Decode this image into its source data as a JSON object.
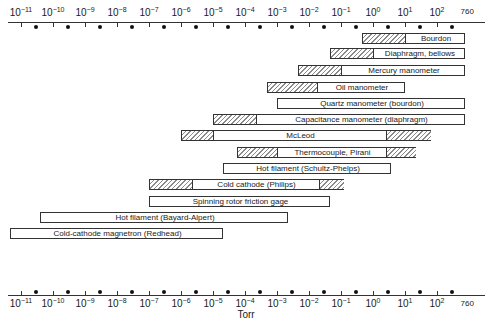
{
  "chart_data": {
    "type": "bar",
    "subtype": "floating-range-bar",
    "title": "",
    "xlabel": "Torr",
    "ylabel": "",
    "xscale": "log",
    "xlim_log10": [
      -11,
      2.88
    ],
    "x_ticks": [
      "10^-11",
      "10^-10",
      "10^-9",
      "10^-8",
      "10^-7",
      "10^-6",
      "10^-5",
      "10^-4",
      "10^-3",
      "10^-2",
      "10^-1",
      "10^0",
      "10^1",
      "10^2",
      "760"
    ],
    "grid": false,
    "legend": "none",
    "series": [
      {
        "name": "Bourdon",
        "range_log10": [
          -0.35,
          2.88
        ],
        "hatched": [
          [
            -0.35,
            1.0
          ]
        ]
      },
      {
        "name": "Diaphragm, bellows",
        "range_log10": [
          -1.35,
          2.88
        ],
        "hatched": [
          [
            -1.35,
            0.0
          ]
        ]
      },
      {
        "name": "Mercury manometer",
        "range_log10": [
          -2.35,
          2.88
        ],
        "hatched": [
          [
            -2.35,
            -1.0
          ]
        ]
      },
      {
        "name": "Oil manometer",
        "range_log10": [
          -3.3,
          1.0
        ],
        "hatched": [
          [
            -3.3,
            -1.75
          ]
        ]
      },
      {
        "name": "Quartz manometer (bourdon)",
        "range_log10": [
          -3.0,
          2.88
        ],
        "hatched": []
      },
      {
        "name": "Capacitance manometer (diaphragm)",
        "range_log10": [
          -5.0,
          2.88
        ],
        "hatched": [
          [
            -5.0,
            -3.65
          ]
        ]
      },
      {
        "name": "McLeod",
        "range_log10": [
          -6.0,
          1.8
        ],
        "hatched": [
          [
            -6.0,
            -5.0
          ],
          [
            0.4,
            1.8
          ]
        ]
      },
      {
        "name": "Thermocouple, Pirani",
        "range_log10": [
          -4.25,
          1.35
        ],
        "hatched": [
          [
            -4.25,
            -3.0
          ],
          [
            0.4,
            1.35
          ]
        ]
      },
      {
        "name": "Hot filament (Schultz-Phelps)",
        "range_log10": [
          -4.7,
          0.55
        ],
        "hatched": []
      },
      {
        "name": "Cold cathode (Philips)",
        "range_log10": [
          -7.0,
          -0.9
        ],
        "hatched": [
          [
            -7.0,
            -5.65
          ],
          [
            -1.7,
            -0.9
          ]
        ]
      },
      {
        "name": "Spinning rotor friction gage",
        "range_log10": [
          -7.0,
          -1.35
        ],
        "hatched": []
      },
      {
        "name": "Hot filament (Bayard-Alpert)",
        "range_log10": [
          -10.4,
          -2.65
        ],
        "hatched": []
      },
      {
        "name": "Cold-cathode magnetron (Redhead)",
        "range_log10": [
          -11.35,
          -4.7
        ],
        "hatched": []
      }
    ]
  },
  "axis": {
    "labels": [
      {
        "base": "10",
        "exp": "−11"
      },
      {
        "base": "10",
        "exp": "−10"
      },
      {
        "base": "10",
        "exp": "−9"
      },
      {
        "base": "10",
        "exp": "−8"
      },
      {
        "base": "10",
        "exp": "−7"
      },
      {
        "base": "10",
        "exp": "−6"
      },
      {
        "base": "10",
        "exp": "−5"
      },
      {
        "base": "10",
        "exp": "−4"
      },
      {
        "base": "10",
        "exp": "−3"
      },
      {
        "base": "10",
        "exp": "−2"
      },
      {
        "base": "10",
        "exp": "−1"
      },
      {
        "base": "10",
        "exp": "0"
      },
      {
        "base": "10",
        "exp": "1"
      },
      {
        "base": "10",
        "exp": "2"
      }
    ],
    "end_label": "760",
    "unit": "Torr"
  }
}
